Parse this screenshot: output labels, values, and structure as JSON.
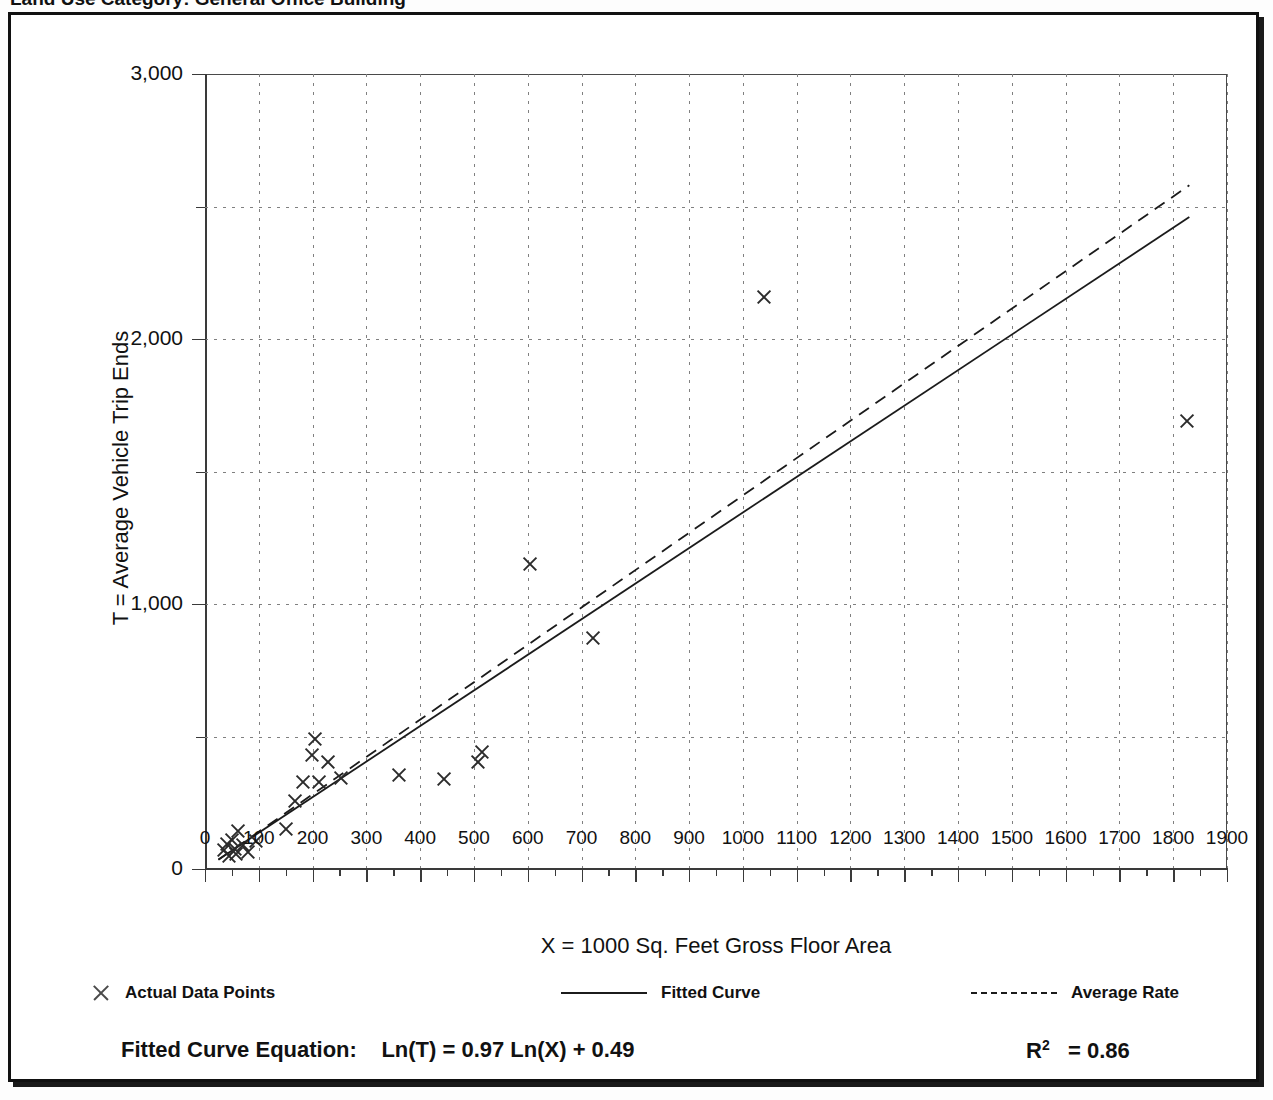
{
  "top_cut_text": "Land Use Category: General Office Building",
  "axes": {
    "x_title": "X = 1000 Sq. Feet Gross Floor Area",
    "y_title": "T = Average Vehicle Trip Ends",
    "x_ticks": [
      0,
      100,
      200,
      300,
      400,
      500,
      600,
      700,
      800,
      900,
      1000,
      1100,
      1200,
      1300,
      1400,
      1500,
      1600,
      1700,
      1800,
      1900
    ],
    "x_tick_labels": [
      "0",
      "100",
      "200",
      "300",
      "400",
      "500",
      "600",
      "700",
      "800",
      "900",
      "1000",
      "1100",
      "1200",
      "1300",
      "1400",
      "1500",
      "1600",
      "1700",
      "1800",
      "1900"
    ],
    "y_ticks": [
      0,
      1000,
      2000,
      3000
    ],
    "y_tick_labels": [
      "0",
      "1,000",
      "2,000",
      "3,000"
    ],
    "y_minor_ticks": [
      500,
      1500,
      2500
    ],
    "x_min": 0,
    "x_max": 1900,
    "y_min": 0,
    "y_max": 3000
  },
  "legend": {
    "items": [
      {
        "marker": "x-marker",
        "label": "Actual Data Points"
      },
      {
        "marker": "solid-line",
        "label": "Fitted Curve"
      },
      {
        "marker": "dashed-line",
        "label": "Average Rate"
      }
    ]
  },
  "equation": {
    "label": "Fitted Curve Equation:",
    "formula": "Ln(T) = 0.97 Ln(X) + 0.49",
    "r_squared_label": "R",
    "r_squared_exp": "2",
    "r_squared_value": "= 0.86",
    "r_squared_full": "R2 = 0.86"
  },
  "colors": {
    "ink": "#111111",
    "grid": "#808080",
    "marker": "#2b2b2b",
    "line": "#1b1b1b",
    "frame": "#111111"
  },
  "chart_data": {
    "type": "scatter",
    "title": "",
    "xlabel": "X = 1000 Sq. Feet Gross Floor Area",
    "ylabel": "T = Average Vehicle Trip Ends",
    "xlim": [
      0,
      1900
    ],
    "ylim": [
      0,
      3000
    ],
    "grid": true,
    "legend_position": "below-axes",
    "series": [
      {
        "name": "Actual Data Points",
        "type": "scatter",
        "marker": "x",
        "points": [
          [
            35,
            70
          ],
          [
            40,
            95
          ],
          [
            45,
            50
          ],
          [
            50,
            110
          ],
          [
            55,
            75
          ],
          [
            58,
            55
          ],
          [
            62,
            145
          ],
          [
            70,
            90
          ],
          [
            80,
            65
          ],
          [
            95,
            105
          ],
          [
            150,
            150
          ],
          [
            168,
            255
          ],
          [
            183,
            330
          ],
          [
            198,
            430
          ],
          [
            205,
            490
          ],
          [
            212,
            330
          ],
          [
            228,
            405
          ],
          [
            252,
            345
          ],
          [
            360,
            355
          ],
          [
            445,
            340
          ],
          [
            508,
            405
          ],
          [
            515,
            440
          ],
          [
            605,
            1150
          ],
          [
            722,
            870
          ],
          [
            1040,
            2160
          ],
          [
            1825,
            1690
          ]
        ]
      },
      {
        "name": "Fitted Curve",
        "type": "line",
        "style": "solid",
        "equation": "Ln(T) = 0.97 Ln(X) + 0.49",
        "coef_slope": 0.97,
        "coef_intercept": 0.49,
        "r_squared": 0.86,
        "x_range": [
          25,
          1830
        ],
        "endpoints": [
          [
            25,
            36
          ],
          [
            1830,
            2460
          ]
        ]
      },
      {
        "name": "Average Rate",
        "type": "line",
        "style": "dashed",
        "rate_per_unit": 1.41,
        "x_range": [
          25,
          1830
        ],
        "endpoints": [
          [
            25,
            35
          ],
          [
            1830,
            2580
          ]
        ]
      }
    ]
  }
}
